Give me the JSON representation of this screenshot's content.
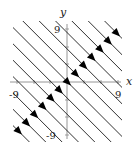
{
  "figure": {
    "type": "phase-portrait",
    "axes": {
      "x_label": "x",
      "y_label": "y",
      "x_ticks": [
        {
          "value": -9,
          "label": "-9"
        },
        {
          "value": 9,
          "label": "9"
        }
      ],
      "y_ticks": [
        {
          "value": 9,
          "label": "9"
        },
        {
          "value": -9,
          "label": "-9"
        }
      ],
      "range": [
        -9.5,
        9.5
      ]
    },
    "flow_lines": {
      "family": "y = -x + c",
      "c_values": [
        -18,
        -15,
        -12,
        -9,
        -6,
        -3,
        0,
        3,
        6,
        9,
        12,
        15,
        18
      ],
      "arrow_direction": "down-right",
      "arrow_positions": "on the line y = x"
    },
    "colors": {
      "lines": "#1a1a1a",
      "axes": "#888888",
      "arrows": "#000000"
    }
  }
}
